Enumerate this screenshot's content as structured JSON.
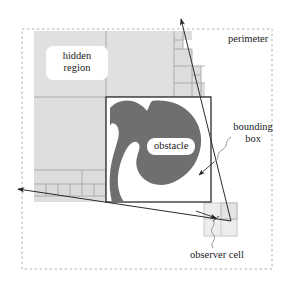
{
  "figure": {
    "kind": "diagram",
    "title_visible": false,
    "width": 294,
    "height": 291,
    "background": "#ffffff"
  },
  "labels": {
    "hidden_region": "hidden\nregion",
    "hidden_region_line1": "hidden",
    "hidden_region_line2": "region",
    "obstacle": "obstacle",
    "perimeter": "perimeter",
    "bounding_box_line1": "bounding",
    "bounding_box_line2": "box",
    "observer_cell": "observer cell"
  },
  "colors": {
    "background": "#ffffff",
    "hidden_region_fill": "#dfe1df",
    "hidden_region_fill_alt": "#d9dbd9",
    "obstacle_fill": "#6f6f6f",
    "line": "#2b2b2b",
    "cell_line": "#9a9a9a",
    "perimeter_dash": "#aaaaaa",
    "leader_line": "#8d8d8d",
    "text": "#1a1a1a"
  },
  "geometry": {
    "perimeter_rect": {
      "x": 22,
      "y": 29,
      "width": 250,
      "height": 240,
      "style": "dashed"
    },
    "bounding_box_rect": {
      "x": 106,
      "y": 97,
      "width": 105,
      "height": 105,
      "style": "solid"
    },
    "observer_cell_rect": {
      "x": 204,
      "y": 203,
      "width": 33,
      "height": 33,
      "style": "solid-light"
    },
    "quadtree_root": {
      "x": 34,
      "y": 31,
      "width": 177,
      "height": 171
    },
    "quadtree_split_x": 106,
    "quadtree_split_y": 97,
    "sight_line_upper": {
      "from": [
        232,
        222
      ],
      "to": [
        180,
        17
      ]
    },
    "sight_line_lower": {
      "from": [
        232,
        222
      ],
      "to": [
        16,
        188
      ]
    },
    "arrow_heads": 3
  },
  "shaded_cells": {
    "top_left_quadrant": "uniform shaded cell",
    "bottom_left_quadrant": "uniform shaded cell",
    "top_right_staircase_cells": 9,
    "bottom_left_staircase_cells": 11
  }
}
